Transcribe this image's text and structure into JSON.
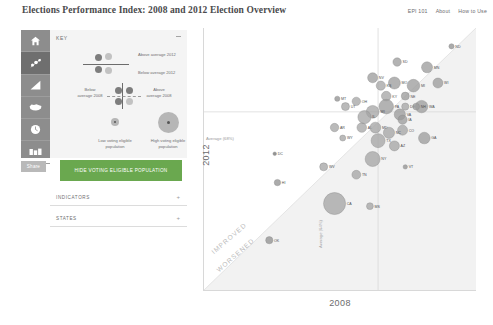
{
  "header": {
    "title": "Elections Performance Index: 2008 and 2012 Election Overview",
    "nav": [
      {
        "label": "EPI 101"
      },
      {
        "label": "About"
      },
      {
        "label": "How to Use"
      }
    ]
  },
  "sidebar": {
    "rail": [
      {
        "icon": "home-icon",
        "active": false
      },
      {
        "icon": "scatter-chart-icon",
        "active": true
      },
      {
        "icon": "bar-chart-icon",
        "active": false
      },
      {
        "icon": "map-icon",
        "active": false
      },
      {
        "icon": "clock-icon",
        "active": false
      },
      {
        "icon": "compare-icon",
        "active": false
      }
    ],
    "share_label": "Share",
    "key": {
      "title": "KEY",
      "collapse_icon": "minus-icon",
      "above_2012": "Above average 2012",
      "below_2012": "Below average 2012",
      "below_2008": "Below average 2008",
      "above_2008": "Above average 2008",
      "low_vep": "Low voting eligible population",
      "high_vep": "High voting eligible population",
      "color_dark": "#7d7d7d",
      "color_light": "#c2c2c2"
    },
    "hide_vep_button": "HIDE VOTING ELIGIBLE POPULATION",
    "accordions": [
      {
        "label": "INDICATORS",
        "toggle": "+"
      },
      {
        "label": "STATES",
        "toggle": "+"
      }
    ],
    "accent_green": "#6aa84f"
  },
  "chart_data": {
    "type": "scatter",
    "title": "Elections Performance Index: 2008 and 2012 Election Overview",
    "xlabel": "2008",
    "ylabel": "2012",
    "xlim": [
      0,
      100
    ],
    "ylim": [
      0,
      100
    ],
    "grid": false,
    "annotations": {
      "average_y": "Average (68%)",
      "average_x": "Average (64%)",
      "improved": "IMPROVED",
      "worsened": "WORSENED",
      "average_x_value": 64,
      "average_y_value": 68
    },
    "size_encoding": "voting eligible population",
    "color_encoding": "above/below average 2012",
    "points": [
      {
        "state": "ND",
        "x": 91,
        "y": 93,
        "r": 2.6,
        "color": "#8f8f8f"
      },
      {
        "state": "MN",
        "x": 82,
        "y": 85,
        "r": 5.5,
        "color": "#9a9a9a"
      },
      {
        "state": "WI",
        "x": 86,
        "y": 79,
        "r": 5.0,
        "color": "#9a9a9a"
      },
      {
        "state": "SD",
        "x": 71,
        "y": 87,
        "r": 4.2,
        "color": "#9a9a9a"
      },
      {
        "state": "NV",
        "x": 62,
        "y": 81,
        "r": 5.0,
        "color": "#9a9a9a"
      },
      {
        "state": "MO",
        "x": 70,
        "y": 79,
        "r": 6.0,
        "color": "#9a9a9a"
      },
      {
        "state": "MI",
        "x": 77,
        "y": 78,
        "r": 6.3,
        "color": "#9a9a9a"
      },
      {
        "state": "MT",
        "x": 49,
        "y": 73,
        "r": 2.6,
        "color": "#8f8f8f"
      },
      {
        "state": "KS",
        "x": 65,
        "y": 78,
        "r": 4.6,
        "color": "#a3a3a3"
      },
      {
        "state": "KY",
        "x": 67,
        "y": 74,
        "r": 4.8,
        "color": "#a3a3a3"
      },
      {
        "state": "NE",
        "x": 74,
        "y": 74,
        "r": 4.0,
        "color": "#9a9a9a"
      },
      {
        "state": "PA",
        "x": 67,
        "y": 70,
        "r": 7.3,
        "color": "#9a9a9a"
      },
      {
        "state": "DE",
        "x": 74,
        "y": 70,
        "r": 3.6,
        "color": "#a3a3a3"
      },
      {
        "state": "WA",
        "x": 80,
        "y": 70,
        "r": 6.2,
        "color": "#9a9a9a"
      },
      {
        "state": "NH",
        "x": 78,
        "y": 70,
        "r": 3.4,
        "color": "#9a9a9a"
      },
      {
        "state": "WI",
        "x": 62,
        "y": 68,
        "r": 6.4,
        "color": "#a3a3a3"
      },
      {
        "state": "VA",
        "x": 72,
        "y": 67,
        "r": 5.6,
        "color": "#9a9a9a"
      },
      {
        "state": "IA",
        "x": 73,
        "y": 65,
        "r": 4.6,
        "color": "#9a9a9a"
      },
      {
        "state": "OH",
        "x": 56,
        "y": 72,
        "r": 4.2,
        "color": "#a3a3a3"
      },
      {
        "state": "UT",
        "x": 52,
        "y": 70,
        "r": 4.0,
        "color": "#a3a3a3"
      },
      {
        "state": "GA",
        "x": 81,
        "y": 58,
        "r": 5.8,
        "color": "#9a9a9a"
      },
      {
        "state": "AL",
        "x": 58,
        "y": 62,
        "r": 4.8,
        "color": "#a3a3a3"
      },
      {
        "state": "AR",
        "x": 48,
        "y": 62,
        "r": 4.2,
        "color": "#a3a3a3"
      },
      {
        "state": "WY",
        "x": 51,
        "y": 58,
        "r": 3.0,
        "color": "#a3a3a3"
      },
      {
        "state": "TX",
        "x": 64,
        "y": 57,
        "r": 7.0,
        "color": "#a3a3a3"
      },
      {
        "state": "NY",
        "x": 62,
        "y": 50,
        "r": 7.5,
        "color": "#a3a3a3"
      },
      {
        "state": "AZ",
        "x": 70,
        "y": 55,
        "r": 5.0,
        "color": "#a3a3a3"
      },
      {
        "state": "DC",
        "x": 26,
        "y": 52,
        "r": 1.8,
        "color": "#6f6f6f"
      },
      {
        "state": "HI",
        "x": 27,
        "y": 41,
        "r": 3.2,
        "color": "#8f8f8f"
      },
      {
        "state": "WV",
        "x": 44,
        "y": 47,
        "r": 4.0,
        "color": "#a3a3a3"
      },
      {
        "state": "TN",
        "x": 56,
        "y": 44,
        "r": 4.4,
        "color": "#a3a3a3"
      },
      {
        "state": "CA",
        "x": 48,
        "y": 33,
        "r": 11.0,
        "color": "#a3a3a3"
      },
      {
        "state": "MS",
        "x": 61,
        "y": 32,
        "r": 3.4,
        "color": "#a3a3a3"
      },
      {
        "state": "OK",
        "x": 24,
        "y": 19,
        "r": 3.6,
        "color": "#8f8f8f"
      },
      {
        "state": "VT",
        "x": 74,
        "y": 47,
        "r": 2.2,
        "color": "#8f8f8f"
      },
      {
        "state": "MD",
        "x": 63,
        "y": 62,
        "r": 5.4,
        "color": "#a3a3a3"
      },
      {
        "state": "CO",
        "x": 73,
        "y": 61,
        "r": 5.0,
        "color": "#a3a3a3"
      },
      {
        "state": "IL",
        "x": 59,
        "y": 66,
        "r": 6.6,
        "color": "#a3a3a3"
      },
      {
        "state": "NC",
        "x": 68,
        "y": 60,
        "r": 5.6,
        "color": "#a3a3a3"
      }
    ]
  }
}
